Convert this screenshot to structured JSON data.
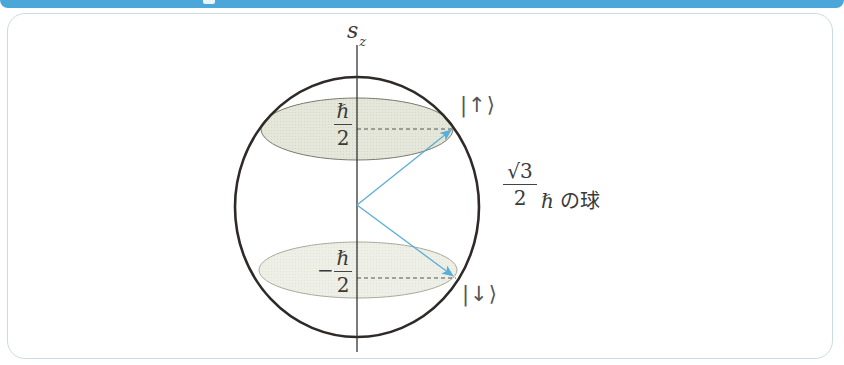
{
  "diagram": {
    "axis_label": "s",
    "axis_subscript": "z",
    "upper_plane": {
      "numerator": "ℏ",
      "denominator": "2",
      "sign": ""
    },
    "lower_plane": {
      "numerator": "ℏ",
      "denominator": "2",
      "sign": "−"
    },
    "ket_up": "|↑⟩",
    "ket_down": "|↓⟩",
    "sphere_label": {
      "numerator": "√3",
      "denominator": "2",
      "suffix": "ℏ の球"
    },
    "colors": {
      "banner": "#4ba6da",
      "card_border": "#c9dbe3",
      "sphere_stroke": "#2f2a28",
      "upper_disc_fill": "#e3e6d8",
      "lower_disc_fill": "#eef0e6",
      "arrow": "#5aaed6"
    }
  }
}
